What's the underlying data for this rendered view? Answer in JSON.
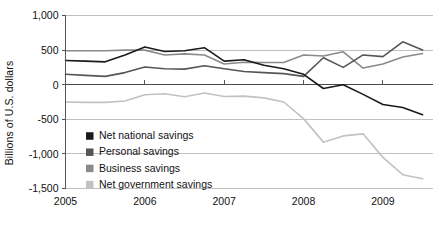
{
  "chart_data": {
    "type": "line",
    "title": "",
    "xlabel": "",
    "ylabel": "Billions of U.S. dollars",
    "ylim": [
      -1500,
      1000
    ],
    "xlim": [
      2005.0,
      2009.625
    ],
    "grid": true,
    "legend_position": "inside-lower-left",
    "ytick_labels": [
      "1,000",
      "500",
      "0",
      "-500",
      "-1,000",
      "-1,500"
    ],
    "ytick_values": [
      1000,
      500,
      0,
      -500,
      -1000,
      -1500
    ],
    "xtick_labels": [
      "2005",
      "2006",
      "2007",
      "2008",
      "2009"
    ],
    "xtick_values": [
      2005,
      2006,
      2007,
      2008,
      2009
    ],
    "x": [
      2005.0,
      2005.25,
      2005.5,
      2005.75,
      2006.0,
      2006.25,
      2006.5,
      2006.75,
      2007.0,
      2007.25,
      2007.5,
      2007.75,
      2008.0,
      2008.25,
      2008.5,
      2008.75,
      2009.0,
      2009.25,
      2009.5
    ],
    "series": [
      {
        "name": "Net national savings",
        "color": "#1a1a1a",
        "values": [
          350,
          340,
          330,
          430,
          545,
          480,
          490,
          535,
          340,
          360,
          280,
          230,
          150,
          -55,
          0,
          -140,
          -285,
          -330,
          -435
        ]
      },
      {
        "name": "Personal savings",
        "color": "#565656",
        "values": [
          150,
          135,
          120,
          175,
          255,
          230,
          225,
          275,
          230,
          190,
          175,
          160,
          120,
          390,
          250,
          430,
          405,
          620,
          500
        ]
      },
      {
        "name": "Business savings",
        "color": "#8a8a8a",
        "values": [
          490,
          490,
          490,
          500,
          500,
          430,
          445,
          430,
          300,
          325,
          320,
          320,
          430,
          415,
          475,
          240,
          300,
          400,
          450
        ]
      },
      {
        "name": "Net government savings",
        "color": "#c2c2c2",
        "values": [
          -250,
          -255,
          -255,
          -235,
          -145,
          -130,
          -175,
          -120,
          -170,
          -165,
          -190,
          -250,
          -490,
          -830,
          -740,
          -710,
          -1050,
          -1300,
          -1360
        ]
      }
    ]
  },
  "legend": {
    "items": [
      {
        "label": "Net national savings",
        "swatch": "#1a1a1a"
      },
      {
        "label": "Personal savings",
        "swatch": "#565656"
      },
      {
        "label": "Business savings",
        "swatch": "#8a8a8a"
      },
      {
        "label": "Net government savings",
        "swatch": "#c2c2c2"
      }
    ]
  }
}
